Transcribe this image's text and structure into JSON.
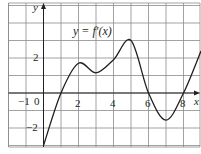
{
  "chart_data": {
    "type": "line",
    "title": "",
    "curve_label": "y = f′(x)",
    "xlabel": "x",
    "ylabel": "y",
    "xlim": [
      -2,
      9
    ],
    "ylim": [
      -3.1,
      5.1
    ],
    "grid": true,
    "grid_step": 1,
    "x_tick_labels": [
      {
        "value": -1,
        "label": "−1"
      },
      {
        "value": 0,
        "label": "0"
      },
      {
        "value": 2,
        "label": "2"
      },
      {
        "value": 4,
        "label": "4"
      },
      {
        "value": 6,
        "label": "6"
      },
      {
        "value": 8,
        "label": "8"
      }
    ],
    "y_tick_labels": [
      {
        "value": 2,
        "label": "2"
      },
      {
        "value": -2,
        "label": "−2"
      }
    ],
    "series": [
      {
        "name": "f′(x)",
        "x": [
          0,
          1,
          2,
          3,
          4,
          5,
          6,
          7,
          8,
          9
        ],
        "y": [
          -3,
          0,
          1.7,
          1.15,
          1.9,
          3,
          0,
          -1.55,
          0,
          2.4
        ]
      }
    ]
  }
}
